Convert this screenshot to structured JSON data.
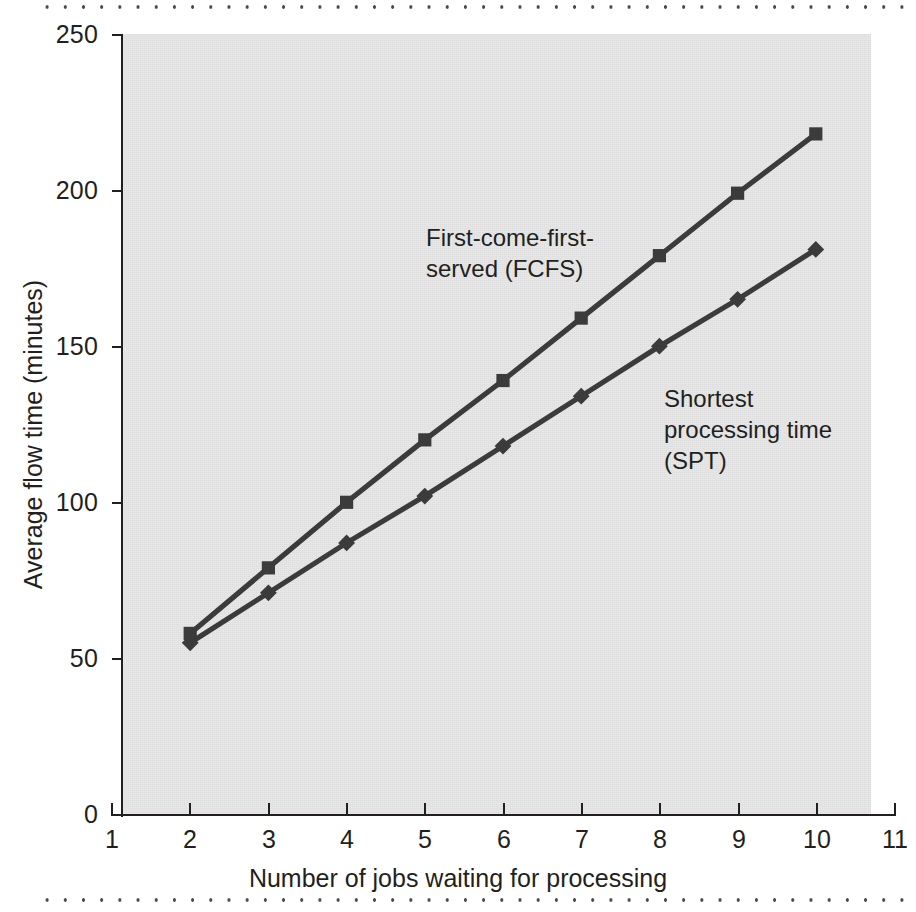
{
  "figure": {
    "background_color": "#ffffff",
    "plot_background_color": "#e8e8e8",
    "ink_color": "#231f20",
    "series_color": "#3b3b3b"
  },
  "chart_data": {
    "type": "line",
    "title": "",
    "xlabel": "Number of jobs waiting for processing",
    "ylabel": "Average flow time (minutes)",
    "xlim": [
      1,
      11
    ],
    "ylim": [
      0,
      250
    ],
    "xticks": [
      1,
      2,
      3,
      4,
      5,
      6,
      7,
      8,
      9,
      10,
      11
    ],
    "yticks": [
      0,
      50,
      100,
      150,
      200,
      250
    ],
    "grid": false,
    "legend_position": "inline-annotations",
    "x": [
      2,
      3,
      4,
      5,
      6,
      7,
      8,
      9,
      10
    ],
    "series": [
      {
        "name": "First-come-first-served (FCFS)",
        "marker": "square",
        "values": [
          58,
          79,
          100,
          120,
          139,
          159,
          179,
          199,
          218
        ]
      },
      {
        "name": "Shortest processing time (SPT)",
        "marker": "diamond",
        "values": [
          55,
          71,
          87,
          102,
          118,
          134,
          150,
          165,
          181
        ]
      }
    ],
    "annotations": [
      {
        "id": "fcfs",
        "text": "First-come-first-\nserved (FCFS)"
      },
      {
        "id": "spt",
        "text": "Shortest\nprocessing time\n(SPT)"
      }
    ]
  },
  "axes": {
    "y_tick_labels": [
      "250",
      "200",
      "150",
      "100",
      "50",
      "0"
    ],
    "x_tick_labels": [
      "1",
      "2",
      "3",
      "4",
      "5",
      "6",
      "7",
      "8",
      "9",
      "10",
      "11"
    ],
    "x_title": "Number of jobs waiting for processing",
    "y_title": "Average flow time (minutes)"
  }
}
